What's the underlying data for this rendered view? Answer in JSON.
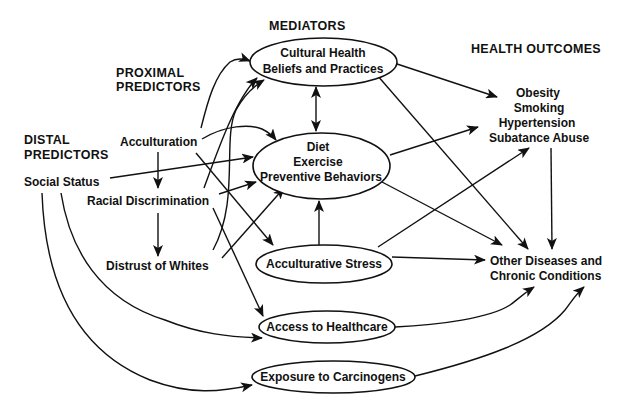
{
  "diagram": {
    "type": "conceptual-model",
    "headers": {
      "mediators": "MEDIATORS",
      "health_outcomes": "HEALTH OUTCOMES",
      "proximal_1": "PROXIMAL",
      "proximal_2": "PREDICTORS",
      "distal_1": "DISTAL",
      "distal_2": "PREDICTORS"
    },
    "predictors": {
      "social_status": "Social Status",
      "acculturation": "Acculturation",
      "racial_discrimination": "Racial Discrimination",
      "distrust_of_whites": "Distrust of Whites"
    },
    "mediators": {
      "cultural_1": "Cultural Health",
      "cultural_2": "Beliefs and Practices",
      "diet_1": "Diet",
      "diet_2": "Exercise",
      "diet_3": "Preventive Behaviors",
      "stress": "Acculturative Stress",
      "access": "Access to Healthcare",
      "exposure": "Exposure to Carcinogens"
    },
    "outcomes": {
      "behavioral_1": "Obesity",
      "behavioral_2": "Smoking",
      "behavioral_3": "Hypertension",
      "behavioral_4": "Subatance Abuse",
      "chronic_1": "Other Diseases and",
      "chronic_2": "Chronic Conditions"
    },
    "edges": [
      [
        "Social Status",
        "Diet Exercise Preventive Behaviors"
      ],
      [
        "Social Status",
        "Access to Healthcare"
      ],
      [
        "Social Status",
        "Exposure to Carcinogens"
      ],
      [
        "Acculturation",
        "Racial Discrimination"
      ],
      [
        "Acculturation",
        "Cultural Health Beliefs and Practices"
      ],
      [
        "Acculturation",
        "Diet Exercise Preventive Behaviors"
      ],
      [
        "Acculturation",
        "Acculturative Stress"
      ],
      [
        "Racial Discrimination",
        "Distrust of Whites"
      ],
      [
        "Racial Discrimination",
        "Cultural Health Beliefs and Practices"
      ],
      [
        "Racial Discrimination",
        "Diet Exercise Preventive Behaviors"
      ],
      [
        "Racial Discrimination",
        "Access to Healthcare"
      ],
      [
        "Distrust of Whites",
        "Cultural Health Beliefs and Practices"
      ],
      [
        "Distrust of Whites",
        "Diet Exercise Preventive Behaviors"
      ],
      [
        "Cultural Health Beliefs and Practices",
        "Diet Exercise Preventive Behaviors (bidirectional)"
      ],
      [
        "Cultural Health Beliefs and Practices",
        "Obesity/Smoking/Hypertension/Subatance Abuse"
      ],
      [
        "Cultural Health Beliefs and Practices",
        "Other Diseases and Chronic Conditions"
      ],
      [
        "Diet Exercise Preventive Behaviors",
        "Obesity/Smoking/Hypertension/Subatance Abuse"
      ],
      [
        "Diet Exercise Preventive Behaviors",
        "Other Diseases and Chronic Conditions"
      ],
      [
        "Acculturative Stress",
        "Diet Exercise Preventive Behaviors"
      ],
      [
        "Acculturative Stress",
        "Obesity/Smoking/Hypertension/Subatance Abuse"
      ],
      [
        "Acculturative Stress",
        "Other Diseases and Chronic Conditions"
      ],
      [
        "Access to Healthcare",
        "Other Diseases and Chronic Conditions"
      ],
      [
        "Exposure to Carcinogens",
        "Other Diseases and Chronic Conditions"
      ],
      [
        "Obesity/Smoking/Hypertension/Subatance Abuse",
        "Other Diseases and Chronic Conditions"
      ]
    ]
  }
}
